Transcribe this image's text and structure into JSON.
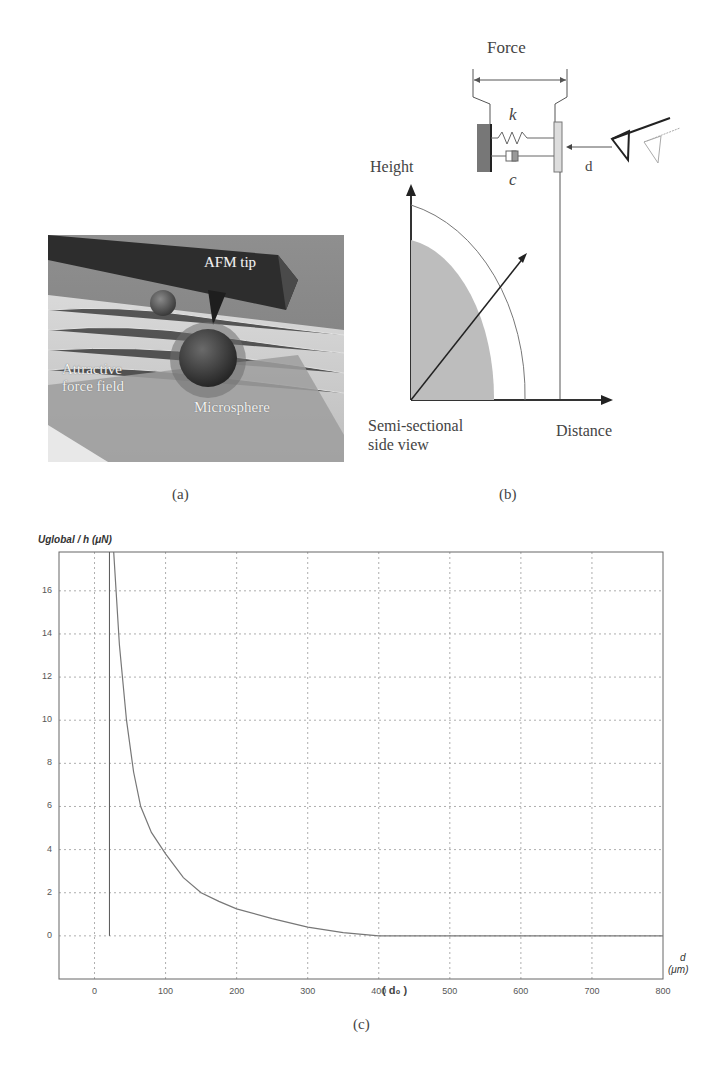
{
  "panel_a": {
    "caption": "(a)",
    "labels": {
      "afm_tip": "AFM tip",
      "attractive_line1": "Attractive",
      "attractive_line2": "force field",
      "microsphere": "Microsphere"
    }
  },
  "panel_b": {
    "caption": "(b)",
    "labels": {
      "force": "Force",
      "spring": "k",
      "damper": "c",
      "distance_d": "d",
      "height": "Height",
      "distance": "Distance",
      "view_line1": "Semi-sectional",
      "view_line2": "side view"
    }
  },
  "panel_c": {
    "caption": "(c)",
    "y_title": "Uglobal / h (μN)",
    "x_title_line1": "d",
    "x_title_line2": "(μm)",
    "d0_label": "( d₀ )"
  },
  "chart_data": {
    "type": "line",
    "title": "",
    "xlabel": "d (μm)",
    "ylabel": "Uglobal / h (μN)",
    "xlim": [
      -50,
      800
    ],
    "ylim": [
      -2,
      17.8
    ],
    "grid": true,
    "x_ticks": [
      0,
      100,
      200,
      300,
      400,
      500,
      600,
      700,
      800
    ],
    "y_ticks": [
      0,
      2,
      4,
      6,
      8,
      10,
      12,
      14,
      16
    ],
    "annotations": [
      {
        "text": "( d₀ )",
        "x": 400,
        "note": "curve reaches zero at d0"
      },
      {
        "text": "vertical line",
        "x": 21,
        "from_y": 0,
        "to_y": 17.8
      }
    ],
    "series": [
      {
        "name": "Uglobal/h",
        "x": [
          27,
          35,
          45,
          55,
          65,
          80,
          100,
          125,
          150,
          175,
          200,
          250,
          300,
          350,
          400,
          500,
          600,
          700,
          800
        ],
        "y": [
          17.8,
          13.5,
          10.0,
          7.6,
          6.0,
          4.8,
          3.8,
          2.7,
          2.0,
          1.6,
          1.25,
          0.8,
          0.4,
          0.15,
          0.0,
          0.0,
          0.0,
          0.0,
          0.0
        ]
      }
    ]
  }
}
